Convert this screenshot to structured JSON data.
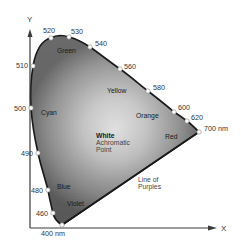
{
  "diagram": {
    "axes": {
      "x_label": "X",
      "y_label": "Y"
    },
    "wavelength_markers": [
      {
        "label": "520",
        "x": 51,
        "y": 38
      },
      {
        "label": "530",
        "x": 69,
        "y": 37
      },
      {
        "label": "540",
        "x": 90,
        "y": 47
      },
      {
        "label": "560",
        "x": 120,
        "y": 69
      },
      {
        "label": "580",
        "x": 148,
        "y": 91
      },
      {
        "label": "600",
        "x": 174,
        "y": 112
      },
      {
        "label": "620",
        "x": 187,
        "y": 121
      },
      {
        "label": "700 nm",
        "x": 199,
        "y": 132
      },
      {
        "label": "510",
        "x": 33,
        "y": 66
      },
      {
        "label": "500",
        "x": 31,
        "y": 108
      },
      {
        "label": "490",
        "x": 38,
        "y": 153
      },
      {
        "label": "480",
        "x": 48,
        "y": 190
      },
      {
        "label": "460",
        "x": 53,
        "y": 213
      },
      {
        "label": "400 nm",
        "x": 62,
        "y": 225
      }
    ],
    "color_regions": {
      "green": "Green",
      "yellow": "Yellow",
      "cyan": "Cyan",
      "orange": "Orange",
      "red": "Red",
      "blue": "Blue",
      "violet": "Violet"
    },
    "white_point": {
      "title": "White",
      "line1": "Achromatic",
      "line2": "Point"
    },
    "line_of_purples": {
      "line1": "Line of",
      "line2": "Purples"
    },
    "colors": {
      "curve": "#1a1a1a",
      "axis": "#3a3a3a",
      "fill_dark": "#6e6e6e",
      "fill_light": "#f4f4f4",
      "marker_fill": "#ffffff"
    }
  }
}
